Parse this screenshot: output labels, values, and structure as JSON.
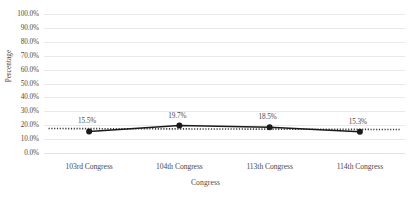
{
  "chart_data": {
    "type": "line",
    "title": "",
    "xlabel": "Congress",
    "ylabel": "Percentage",
    "categories": [
      "103rd Congress",
      "104th Congress",
      "113th Congress",
      "114th Congress"
    ],
    "values": [
      15.5,
      19.7,
      18.5,
      15.3
    ],
    "data_labels": [
      "15.5%",
      "19.7%",
      "18.5%",
      "15.3%"
    ],
    "ylim": [
      0,
      100
    ],
    "ytick_labels": [
      "0.0%",
      "10.0%",
      "20.0%",
      "30.0%",
      "40.0%",
      "50.0%",
      "60.0%",
      "70.0%",
      "80.0%",
      "90.0%",
      "100.0%"
    ],
    "ytick_values": [
      0,
      10,
      20,
      30,
      40,
      50,
      60,
      70,
      80,
      90,
      100
    ],
    "grid": true,
    "legend": "none",
    "series": [
      {
        "name": "Percentage",
        "style": "solid-line-with-round-markers",
        "color": "#1a1a1a",
        "values": [
          15.5,
          19.7,
          18.5,
          15.3
        ]
      },
      {
        "name": "Trendline",
        "style": "dotted",
        "color": "#3a3a3a",
        "values": [
          15.5,
          19.7,
          18.5,
          15.3
        ]
      }
    ],
    "colors": {
      "line": "#1a1a1a",
      "marker": "#1a1a1a",
      "trendline": "#3a3a3a",
      "gridline": "#e9e9e9",
      "text": "#4a4a4a",
      "background": "#ffffff"
    }
  }
}
